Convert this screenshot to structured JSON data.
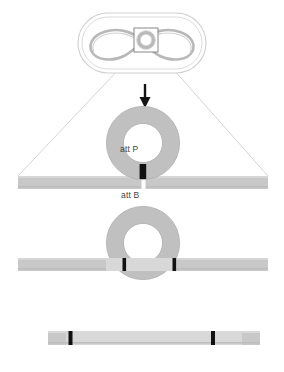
{
  "figure": {
    "background_color": "#ffffff"
  },
  "palette": {
    "dna_gray": "#c8c8c8",
    "dna_gray_dark": "#b4b4b4",
    "ring_gray": "#c0c0c0",
    "ring_outline": "#a8a8a8",
    "integrated_light": "#d8d8d8",
    "att_black": "#111111",
    "att_white": "#ffffff",
    "guide_line": "#cfcfcf",
    "cell_outline": "#cccccc",
    "chromosome_gray": "#b8b8b8",
    "arrow_black": "#141414",
    "text_gray": "#3f3f3f",
    "box_outline": "#7a7a7a"
  },
  "cell_panel": {
    "name": "bacterial-cell",
    "shape": "rod-shaped capsule with double outline",
    "chromosome": {
      "name": "chromosome",
      "shape": "figure-eight supercoiled loop"
    },
    "plasmid_callout_box": {
      "name": "plasmid-box",
      "contents": "small circular plasmid ring"
    }
  },
  "arrow": {
    "name": "integration-arrow",
    "direction": "down"
  },
  "magnified_panel": {
    "name": "magnification-trapezoid",
    "plasmid_ring": {
      "name": "plasmid-ring",
      "att_site_label": "att P",
      "att_site_color": "#111111"
    },
    "chromosome_band_top": {
      "name": "chromosome-band-top",
      "att_site_label": "att B",
      "att_site_color": "#ffffff"
    },
    "intermediate": {
      "name": "integration-intermediate",
      "description": "plasmid ring fused into chromosome band flanked by two att sites"
    },
    "integrated_band": {
      "name": "integrated-chromosome-band",
      "description": "linear chromosome with integrated plasmid DNA between two att sites"
    }
  },
  "labels": {
    "att_p": "att P",
    "att_b": "att B"
  }
}
